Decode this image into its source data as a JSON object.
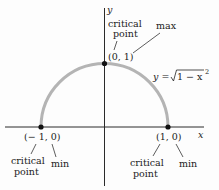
{
  "figure": {
    "axes": {
      "x_label": "x",
      "y_label": "y"
    },
    "curve": {
      "equation_lhs": "y = ",
      "equation_radicand": "1 − x",
      "equation_exponent": "2",
      "color": "#b4b4b4"
    },
    "points": [
      {
        "coord_label": "(0, 1)",
        "annotation_1_line1": "critical",
        "annotation_1_line2": "point",
        "annotation_2": "max"
      },
      {
        "coord_label": "(− 1, 0)",
        "annotation_1_line1": "critical",
        "annotation_1_line2": "point",
        "annotation_2": "min"
      },
      {
        "coord_label": "(1, 0)",
        "annotation_1_line1": "critical",
        "annotation_1_line2": "point",
        "annotation_2": "min"
      }
    ]
  }
}
